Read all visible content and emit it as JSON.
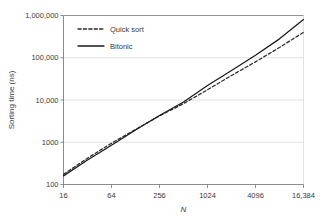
{
  "chart_data": {
    "type": "line",
    "title": "",
    "xlabel": "N",
    "ylabel": "Sorting time (ns)",
    "xscale": "log2",
    "yscale": "log10",
    "xlim": [
      16,
      16384
    ],
    "ylim": [
      100,
      1000000
    ],
    "grid": true,
    "grid_axis": "y",
    "legend_position": "top-left-inside",
    "xticks": [
      16,
      64,
      256,
      1024,
      4096,
      16384
    ],
    "xtick_labels": [
      "16",
      "64",
      "256",
      "1024",
      "4096",
      "16,384"
    ],
    "yticks": [
      100,
      1000,
      10000,
      100000,
      1000000
    ],
    "ytick_labels": [
      "100",
      "1000",
      "10,000",
      "100,000",
      "1,000,000"
    ],
    "series": [
      {
        "name": "Quick sort",
        "style": "dashed",
        "color": "#2b2b2b",
        "x": [
          16,
          32,
          64,
          128,
          256,
          512,
          1024,
          2048,
          4096,
          8192,
          16384
        ],
        "y": [
          175,
          420,
          950,
          2000,
          4200,
          8200,
          17500,
          38000,
          80000,
          175000,
          400000
        ]
      },
      {
        "name": "Bitonic",
        "style": "solid",
        "color": "#1a1a1a",
        "x": [
          16,
          32,
          64,
          128,
          256,
          512,
          1024,
          2048,
          4096,
          8192,
          16384
        ],
        "y": [
          160,
          380,
          850,
          1950,
          4300,
          9000,
          22000,
          50000,
          115000,
          280000,
          800000
        ]
      }
    ]
  },
  "legend": {
    "items": [
      {
        "label": "Quick sort",
        "style": "dashed"
      },
      {
        "label": "Bitonic",
        "style": "solid"
      }
    ]
  },
  "colors": {
    "axis": "#7f7f7f",
    "grid": "#d9d9d9",
    "text": "#3a3a3a",
    "line_solid": "#1a1a1a",
    "line_dashed": "#2b2b2b",
    "background": "#ffffff"
  }
}
